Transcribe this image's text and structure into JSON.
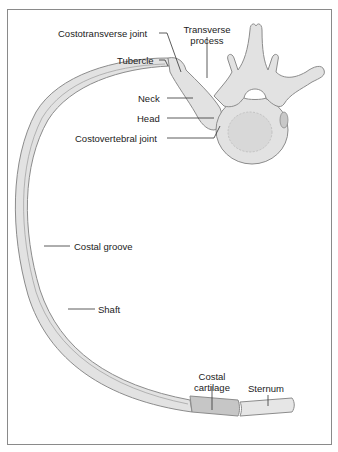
{
  "figure": {
    "type": "anatomical-illustration",
    "colors": {
      "bone_fill": "#e2e2e2",
      "bone_stroke": "#8c8c8c",
      "cartilage_fill": "#c6c6c6",
      "label_text": "#222222",
      "leader_line": "#333333",
      "frame_border": "#8a8a8a"
    }
  },
  "labels": {
    "costotransverse_joint": "Costotransverse joint",
    "transverse_process_1": "Transverse",
    "transverse_process_2": "process",
    "tubercle": "Tubercle",
    "neck": "Neck",
    "head": "Head",
    "costovertebral_joint": "Costovertebral joint",
    "costal_groove": "Costal groove",
    "shaft": "Shaft",
    "costal_cartilage_1": "Costal",
    "costal_cartilage_2": "cartilage",
    "sternum": "Sternum"
  }
}
